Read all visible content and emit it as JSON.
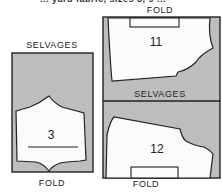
{
  "caption_partial": "... yard fabric, sizes 8, 9 ...",
  "colors": {
    "fabric": "#bdbdbd",
    "piece": "#fbfbfb",
    "outline": "#222222",
    "background": "#ffffff"
  },
  "left_layout": {
    "top_label": "SELVAGES",
    "bottom_label": "FOLD",
    "pieces": [
      {
        "number": "3",
        "has_grainline": true
      }
    ]
  },
  "right_layout": {
    "top_label": "FOLD",
    "middle_label": "SELVAGES",
    "bottom_label": "FOLD",
    "pieces": [
      {
        "number": "11",
        "fold_mark": "top"
      },
      {
        "number": "12",
        "fold_mark": "bottom"
      }
    ]
  }
}
